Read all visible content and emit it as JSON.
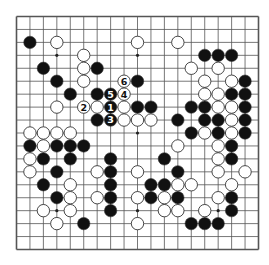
{
  "game": "go",
  "board_size": 19,
  "star_points": [
    [
      3,
      3
    ],
    [
      9,
      3
    ],
    [
      15,
      3
    ],
    [
      3,
      9
    ],
    [
      9,
      9
    ],
    [
      15,
      9
    ],
    [
      3,
      15
    ],
    [
      9,
      15
    ],
    [
      15,
      15
    ]
  ],
  "colors": {
    "board": "#ffffff",
    "line": "#555555",
    "black": "#111111",
    "white": "#ffffff",
    "stone_outline": "#333333"
  },
  "black_stones": [
    [
      1,
      2
    ],
    [
      2,
      4
    ],
    [
      3,
      5
    ],
    [
      4,
      6
    ],
    [
      6,
      4
    ],
    [
      6,
      6
    ],
    [
      6,
      8
    ],
    [
      9,
      5
    ],
    [
      9,
      7
    ],
    [
      10,
      7
    ],
    [
      13,
      7
    ],
    [
      14,
      7
    ],
    [
      12,
      8
    ],
    [
      14,
      8
    ],
    [
      15,
      8
    ],
    [
      13,
      9
    ],
    [
      15,
      9
    ],
    [
      14,
      3
    ],
    [
      15,
      3
    ],
    [
      16,
      3
    ],
    [
      17,
      5
    ],
    [
      16,
      6
    ],
    [
      17,
      6
    ],
    [
      17,
      7
    ],
    [
      17,
      8
    ],
    [
      17,
      9
    ],
    [
      16,
      10
    ],
    [
      16,
      11
    ],
    [
      11,
      11
    ],
    [
      12,
      12
    ],
    [
      11,
      13
    ],
    [
      10,
      13
    ],
    [
      10,
      14
    ],
    [
      12,
      14
    ],
    [
      16,
      14
    ],
    [
      16,
      15
    ],
    [
      13,
      16
    ],
    [
      14,
      16
    ],
    [
      15,
      16
    ],
    [
      1,
      10
    ],
    [
      3,
      10
    ],
    [
      4,
      10
    ],
    [
      5,
      10
    ],
    [
      2,
      11
    ],
    [
      4,
      11
    ],
    [
      3,
      12
    ],
    [
      2,
      13
    ],
    [
      3,
      14
    ],
    [
      5,
      16
    ],
    [
      7,
      11
    ],
    [
      7,
      12
    ],
    [
      7,
      13
    ],
    [
      7,
      14
    ],
    [
      7,
      15
    ]
  ],
  "white_stones": [
    [
      3,
      2
    ],
    [
      9,
      2
    ],
    [
      12,
      2
    ],
    [
      5,
      3
    ],
    [
      5,
      4
    ],
    [
      5,
      5
    ],
    [
      13,
      4
    ],
    [
      15,
      4
    ],
    [
      14,
      5
    ],
    [
      16,
      5
    ],
    [
      14,
      6
    ],
    [
      15,
      6
    ],
    [
      15,
      7
    ],
    [
      16,
      7
    ],
    [
      16,
      8
    ],
    [
      14,
      9
    ],
    [
      16,
      9
    ],
    [
      12,
      10
    ],
    [
      15,
      10
    ],
    [
      15,
      11
    ],
    [
      15,
      12
    ],
    [
      17,
      12
    ],
    [
      12,
      13
    ],
    [
      13,
      13
    ],
    [
      16,
      13
    ],
    [
      15,
      14
    ],
    [
      14,
      15
    ],
    [
      12,
      15
    ],
    [
      11,
      15
    ],
    [
      11,
      14
    ],
    [
      9,
      12
    ],
    [
      9,
      14
    ],
    [
      9,
      16
    ],
    [
      8,
      8
    ],
    [
      9,
      8
    ],
    [
      10,
      8
    ],
    [
      6,
      7
    ],
    [
      8,
      7
    ],
    [
      3,
      7
    ],
    [
      1,
      9
    ],
    [
      2,
      9
    ],
    [
      3,
      9
    ],
    [
      4,
      9
    ],
    [
      2,
      10
    ],
    [
      1,
      11
    ],
    [
      1,
      12
    ],
    [
      6,
      12
    ],
    [
      4,
      13
    ],
    [
      4,
      14
    ],
    [
      6,
      14
    ],
    [
      2,
      15
    ],
    [
      4,
      15
    ],
    [
      3,
      16
    ]
  ],
  "numbered_moves": [
    {
      "number": "1",
      "color": "black",
      "point": [
        7,
        7
      ]
    },
    {
      "number": "2",
      "color": "white",
      "point": [
        5,
        7
      ]
    },
    {
      "number": "3",
      "color": "black",
      "point": [
        7,
        8
      ]
    },
    {
      "number": "4",
      "color": "white",
      "point": [
        8,
        6
      ]
    },
    {
      "number": "5",
      "color": "black",
      "point": [
        7,
        6
      ]
    },
    {
      "number": "6",
      "color": "white",
      "point": [
        8,
        5
      ]
    }
  ]
}
